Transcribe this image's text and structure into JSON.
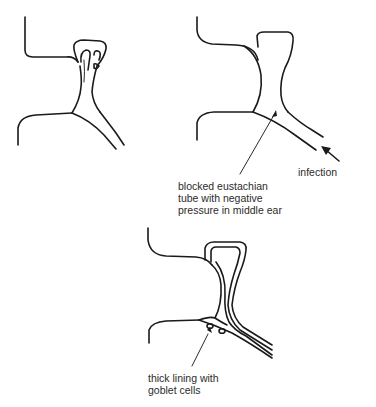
{
  "figure": {
    "panels": [
      {
        "id": "normal",
        "description": "Normal middle ear and eustachian tube"
      },
      {
        "id": "blocked",
        "description": "Blocked eustachian tube",
        "labels": [
          {
            "text": "infection",
            "pointer": "arrow"
          },
          {
            "text": "blocked eustachian\ntube with negative\npressure in middle ear",
            "pointer": "line"
          }
        ]
      },
      {
        "id": "thickened",
        "description": "Thickened lining",
        "labels": [
          {
            "text": "thick lining with\ngoblet cells",
            "pointer": "line"
          }
        ]
      }
    ]
  },
  "labels": {
    "infection": "infection",
    "blocked": "blocked eustachian\ntube with negative\npressure in middle ear",
    "thick_lining": "thick lining with\ngoblet cells"
  },
  "colors": {
    "ink": "#1a1a1a",
    "background": "#ffffff"
  }
}
